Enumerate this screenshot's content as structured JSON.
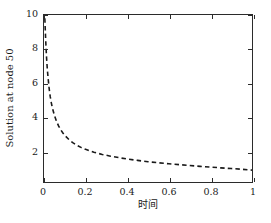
{
  "chart_data": {
    "type": "line",
    "title": "",
    "xlabel": "时间",
    "ylabel": "Solution at node 50",
    "xlim": [
      0,
      1.0
    ],
    "ylim": [
      0.18,
      10.0
    ],
    "grid": false,
    "legend": null,
    "xticklabels": [
      "0",
      "0.2",
      "0.4",
      "0.6",
      "0.8",
      "1"
    ],
    "xticks": [
      0,
      0.2,
      0.4,
      0.6,
      0.8,
      1
    ],
    "yticklabels": [
      "2",
      "4",
      "6",
      "8",
      "10"
    ],
    "yticks": [
      2,
      4,
      6,
      8,
      10
    ],
    "series": [
      {
        "name": "Solution at node 50",
        "style": "dashed",
        "color": "#1a1a1a",
        "linewidth": 1.6,
        "x": [
          0.004,
          0.008,
          0.012,
          0.016,
          0.02,
          0.025,
          0.03,
          0.035,
          0.04,
          0.05,
          0.06,
          0.07,
          0.08,
          0.09,
          0.1,
          0.12,
          0.14,
          0.16,
          0.18,
          0.2,
          0.24,
          0.28,
          0.32,
          0.36,
          0.4,
          0.45,
          0.5,
          0.55,
          0.6,
          0.65,
          0.7,
          0.75,
          0.8,
          0.85,
          0.9,
          0.95,
          1.0
        ],
        "y": [
          9.8,
          8.55,
          7.55,
          6.8,
          6.25,
          5.65,
          5.2,
          4.85,
          4.55,
          4.1,
          3.75,
          3.48,
          3.26,
          3.08,
          2.92,
          2.67,
          2.48,
          2.33,
          2.2,
          2.1,
          1.93,
          1.8,
          1.7,
          1.61,
          1.53,
          1.45,
          1.37,
          1.31,
          1.25,
          1.2,
          1.15,
          1.1,
          1.06,
          1.01,
          0.97,
          0.93,
          0.88
        ]
      }
    ]
  }
}
